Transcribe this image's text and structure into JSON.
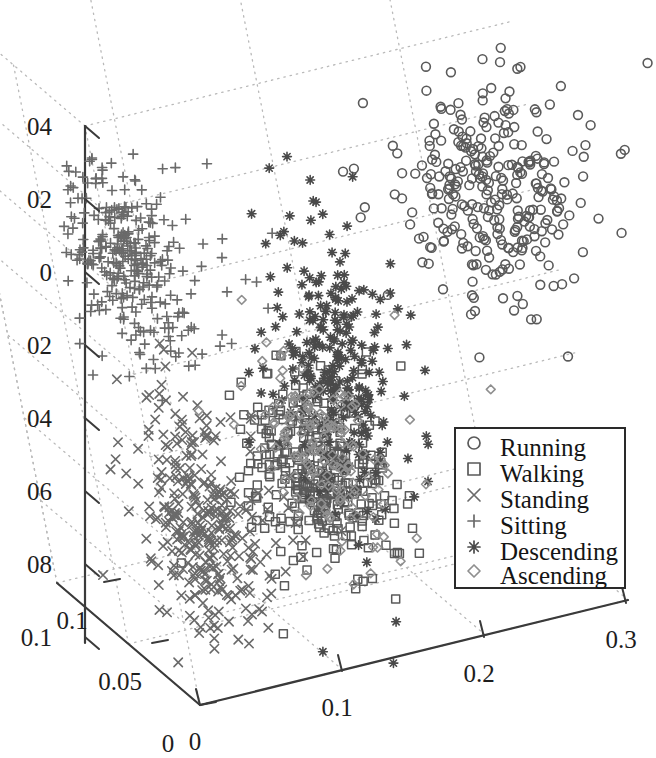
{
  "figure": {
    "title": "",
    "background": "#ffffff",
    "projection": "3d-scatter"
  },
  "chart_data": {
    "type": "scatter",
    "title": "",
    "subtitle": "",
    "xlabel": "",
    "ylabel": "",
    "zlabel": "",
    "grid": true,
    "legend_position": "bottom-right",
    "axes": {
      "x": {
        "name": "x-axis",
        "ticks": [
          0,
          0.1,
          0.2,
          0.3
        ],
        "tick_labels": [
          "0",
          "0.1",
          "0.2",
          "0.3"
        ],
        "range": [
          0,
          0.33
        ],
        "direction": "lower-left-to-upper-right"
      },
      "y": {
        "name": "y-axis",
        "ticks": [
          0,
          0.05,
          0.1
        ],
        "tick_labels": [
          "0",
          "0.05",
          "0.1"
        ],
        "range": [
          0,
          0.125
        ],
        "direction": "lower-right-to-upper-left"
      },
      "z": {
        "name": "z-axis",
        "ticks": [
          0.04,
          0.02,
          0,
          -0.02,
          -0.04,
          -0.06,
          -0.08,
          -0.1
        ],
        "tick_labels": [
          "04",
          "02",
          "0",
          "02",
          "04",
          "06",
          "08",
          "0.1"
        ],
        "tick_labels_note": "left-clipped by image crop; full values 0.04, 0.02, 0, -0.02, -0.04, -0.06, -0.08, -0.1",
        "range": [
          -0.11,
          0.05
        ],
        "direction": "vertical"
      }
    },
    "legend": {
      "entries": [
        {
          "label": "Running",
          "marker": "circle",
          "color": "#5a5a5a"
        },
        {
          "label": "Walking",
          "marker": "square",
          "color": "#5a5a5a"
        },
        {
          "label": "Standing",
          "marker": "x",
          "color": "#6a6a6a"
        },
        {
          "label": "Sitting",
          "marker": "plus",
          "color": "#6a6a6a"
        },
        {
          "label": "Descending",
          "marker": "asterisk",
          "color": "#4a4a4a"
        },
        {
          "label": "Ascending",
          "marker": "diamond",
          "color": "#8f8f8f"
        }
      ]
    },
    "series": [
      {
        "name": "Running",
        "marker": "circle",
        "color": "#5a5a5a",
        "count": 300,
        "cluster": {
          "cx": 492,
          "cy": 196,
          "sx": 42,
          "sy": 58,
          "rot": -0.25,
          "tailx": 34,
          "taily": 44
        }
      },
      {
        "name": "Walking",
        "marker": "square",
        "color": "#5a5a5a",
        "count": 330,
        "cluster": {
          "cx": 318,
          "cy": 470,
          "sx": 33,
          "sy": 52,
          "rot": -0.55,
          "tailx": 42,
          "taily": 50
        }
      },
      {
        "name": "Standing",
        "marker": "x",
        "color": "#6a6a6a",
        "count": 330,
        "cluster": {
          "cx": 200,
          "cy": 520,
          "sx": 26,
          "sy": 66,
          "rot": -0.22,
          "tailx": 52,
          "taily": 56
        }
      },
      {
        "name": "Sitting",
        "marker": "plus",
        "color": "#6a6a6a",
        "count": 330,
        "cluster": {
          "cx": 122,
          "cy": 260,
          "sx": 26,
          "sy": 52,
          "rot": -0.38,
          "tailx": 62,
          "taily": 60
        }
      },
      {
        "name": "Descending",
        "marker": "asterisk",
        "color": "#4a4a4a",
        "count": 270,
        "cluster": {
          "cx": 334,
          "cy": 370,
          "sx": 24,
          "sy": 78,
          "rot": -0.13,
          "tailx": 34,
          "taily": 52
        }
      },
      {
        "name": "Ascending",
        "marker": "diamond",
        "color": "#8f8f8f",
        "count": 150,
        "cluster": {
          "cx": 322,
          "cy": 452,
          "sx": 26,
          "sy": 56,
          "rot": -0.5,
          "tailx": 32,
          "taily": 40
        }
      }
    ]
  },
  "geometry": {
    "origin": [
      200,
      705
    ],
    "x_end": [
      628,
      600
    ],
    "y_end": [
      57,
      583
    ],
    "z_top": [
      85,
      126
    ],
    "x_tick_px": [
      [
        200,
        705
      ],
      [
        342,
        671
      ],
      [
        484,
        637
      ],
      [
        626,
        603
      ]
    ],
    "y_tick_px": [
      [
        200,
        705
      ],
      [
        152,
        643
      ],
      [
        104,
        582
      ]
    ],
    "z_tick_px": [
      [
        85,
        126
      ],
      [
        85,
        199
      ],
      [
        85,
        272
      ],
      [
        85,
        345
      ],
      [
        85,
        418
      ],
      [
        85,
        491
      ],
      [
        85,
        564
      ],
      [
        85,
        637
      ]
    ],
    "x_tick_label_px": [
      [
        195,
        750
      ],
      [
        337,
        716
      ],
      [
        479,
        682
      ],
      [
        621,
        648
      ]
    ],
    "y_tick_label_px": [
      [
        168,
        752
      ],
      [
        120,
        690
      ],
      [
        72,
        629
      ]
    ],
    "z_tick_label_px": [
      [
        52,
        135
      ],
      [
        52,
        208
      ],
      [
        52,
        281
      ],
      [
        52,
        354
      ],
      [
        52,
        427
      ],
      [
        52,
        500
      ],
      [
        52,
        573
      ],
      [
        52,
        646
      ]
    ],
    "legend_box": {
      "x": 455,
      "y": 428,
      "w": 170,
      "h": 160
    },
    "legend_marker_x": 474,
    "legend_label_x": 500,
    "legend_row_y": [
      450,
      476,
      502,
      528,
      554,
      578
    ]
  }
}
